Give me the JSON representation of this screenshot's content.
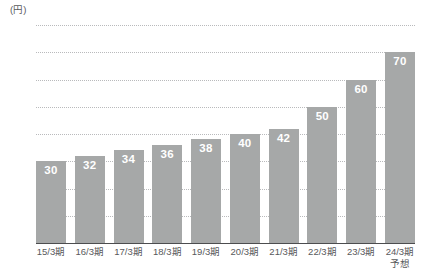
{
  "chart_data": {
    "type": "bar",
    "title": "",
    "subtitle": "",
    "xlabel": "",
    "ylabel": "(円)",
    "unit_label": "(円)",
    "ylim": [
      0,
      80
    ],
    "ytick_step": 10,
    "yticks": [
      "0",
      "10",
      "20",
      "30",
      "40",
      "50",
      "60",
      "70",
      "80"
    ],
    "ytick_values": [
      0,
      10,
      20,
      30,
      40,
      50,
      60,
      70,
      80
    ],
    "grid": "horizontal-dotted",
    "legend": "none",
    "bar_color": "#a6a8a8",
    "axis_color": "#4c4d4f",
    "gridline_color": "#b9babc",
    "value_label_color": "#ffffff",
    "tick_text_color": "#58595b",
    "categories": [
      "15/3期",
      "16/3期",
      "17/3期",
      "18/3期",
      "19/3期",
      "20/3期",
      "21/3期",
      "22/3期",
      "23/3期",
      "24/3期"
    ],
    "category_sublabels": [
      "",
      "",
      "",
      "",
      "",
      "",
      "",
      "",
      "",
      "予想"
    ],
    "values": [
      30,
      32,
      34,
      36,
      38,
      40,
      42,
      50,
      60,
      70
    ],
    "value_labels": [
      "30",
      "32",
      "34",
      "36",
      "38",
      "40",
      "42",
      "50",
      "60",
      "70"
    ]
  }
}
